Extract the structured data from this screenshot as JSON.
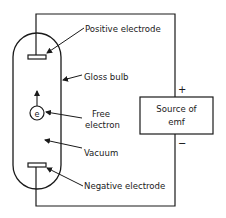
{
  "diagram": {
    "type": "vacuum-tube-circuit",
    "colors": {
      "line": "#1a1a1a",
      "background": "#ffffff"
    },
    "labels": {
      "positive_electrode": "Positive electrode",
      "glass_bulb": "Gloss bulb",
      "free_electron_line1": "Free",
      "free_electron_line2": "electron",
      "vacuum": "Vacuum",
      "negative_electrode": "Negative electrode",
      "source_line1": "Source of",
      "source_line2": "emf",
      "plus": "+",
      "minus": "−",
      "electron_symbol": "e"
    }
  }
}
